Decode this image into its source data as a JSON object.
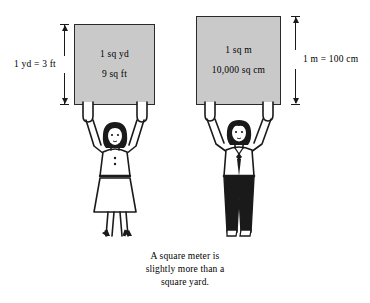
{
  "figure": {
    "background_color": "#ffffff",
    "ink_color": "#1a1a1a",
    "square_fill_color": "#c9c9c9"
  },
  "yard_panel": {
    "square": {
      "line1": "1 sq yd",
      "line2": "9 sq ft"
    },
    "dimension_label": "1 yd = 3 ft"
  },
  "meter_panel": {
    "square": {
      "line1": "1 sq m",
      "line2": "10,000 sq cm"
    },
    "dimension_label": "1 m = 100 cm"
  },
  "caption": {
    "line1": "A square meter is",
    "line2": "slightly more than a",
    "line3": "square yard."
  }
}
